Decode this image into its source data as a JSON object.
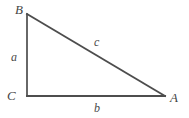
{
  "figure": {
    "kind": "right-triangle-diagram",
    "background_color": "#ffffff",
    "stroke_color": "#4d4d4d",
    "label_color": "#4a4a4a",
    "width": 189,
    "height": 118
  },
  "vertices": [
    {
      "id": "B",
      "label": "B",
      "x": 27,
      "y": 14
    },
    {
      "id": "C",
      "label": "C",
      "x": 27,
      "y": 96
    },
    {
      "id": "A",
      "label": "A",
      "x": 165,
      "y": 96
    }
  ],
  "sides": [
    {
      "id": "a",
      "label": "a",
      "from": "B",
      "to": "C",
      "description": "vertical-left-leg"
    },
    {
      "id": "b",
      "label": "b",
      "from": "C",
      "to": "A",
      "description": "horizontal-bottom-leg"
    },
    {
      "id": "c",
      "label": "c",
      "from": "B",
      "to": "A",
      "description": "hypotenuse"
    }
  ]
}
